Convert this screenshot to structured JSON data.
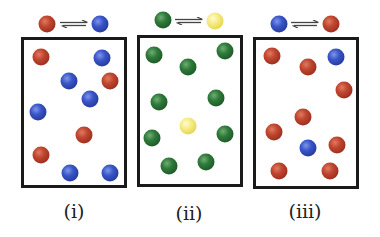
{
  "colors": {
    "red": "#b03b28",
    "blue": "#2f4bb5",
    "green": "#2a6a33",
    "yellow": "#f0e06a",
    "border": "#1a1a1a"
  },
  "panels": [
    {
      "label": "(i)",
      "reaction": {
        "reactant": "red",
        "product": "blue",
        "arrow": "equilibrium-arrows"
      },
      "counts": {
        "red": 4,
        "blue": 6
      },
      "balls": [
        {
          "color": "red",
          "x": 41,
          "y": 57
        },
        {
          "color": "blue",
          "x": 102,
          "y": 58
        },
        {
          "color": "blue",
          "x": 69,
          "y": 81
        },
        {
          "color": "red",
          "x": 110,
          "y": 81
        },
        {
          "color": "blue",
          "x": 90,
          "y": 99
        },
        {
          "color": "blue",
          "x": 38,
          "y": 112
        },
        {
          "color": "red",
          "x": 84,
          "y": 135
        },
        {
          "color": "red",
          "x": 41,
          "y": 155
        },
        {
          "color": "blue",
          "x": 70,
          "y": 173
        },
        {
          "color": "blue",
          "x": 110,
          "y": 173
        }
      ]
    },
    {
      "label": "(ii)",
      "reaction": {
        "reactant": "green",
        "product": "yellow",
        "arrow": "equilibrium-arrows"
      },
      "counts": {
        "green": 9,
        "yellow": 1
      },
      "balls": [
        {
          "color": "green",
          "x": 154,
          "y": 55
        },
        {
          "color": "green",
          "x": 225,
          "y": 51
        },
        {
          "color": "green",
          "x": 188,
          "y": 67
        },
        {
          "color": "green",
          "x": 159,
          "y": 102
        },
        {
          "color": "green",
          "x": 216,
          "y": 98
        },
        {
          "color": "yellow",
          "x": 188,
          "y": 126
        },
        {
          "color": "green",
          "x": 152,
          "y": 138
        },
        {
          "color": "green",
          "x": 225,
          "y": 134
        },
        {
          "color": "green",
          "x": 169,
          "y": 166
        },
        {
          "color": "green",
          "x": 206,
          "y": 162
        }
      ]
    },
    {
      "label": "(iii)",
      "reaction": {
        "reactant": "blue",
        "product": "red",
        "arrow": "equilibrium-arrows"
      },
      "counts": {
        "red": 8,
        "blue": 2
      },
      "balls": [
        {
          "color": "red",
          "x": 272,
          "y": 56
        },
        {
          "color": "blue",
          "x": 336,
          "y": 57
        },
        {
          "color": "red",
          "x": 308,
          "y": 67
        },
        {
          "color": "red",
          "x": 344,
          "y": 90
        },
        {
          "color": "red",
          "x": 303,
          "y": 117
        },
        {
          "color": "red",
          "x": 274,
          "y": 132
        },
        {
          "color": "blue",
          "x": 308,
          "y": 148
        },
        {
          "color": "red",
          "x": 337,
          "y": 145
        },
        {
          "color": "red",
          "x": 279,
          "y": 171
        },
        {
          "color": "red",
          "x": 330,
          "y": 171
        }
      ]
    }
  ]
}
